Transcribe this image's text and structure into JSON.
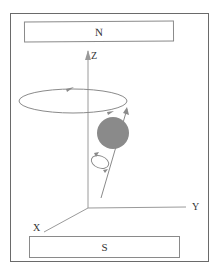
{
  "figure": {
    "poles": {
      "north": "N",
      "south": "S"
    },
    "axes": {
      "z": "Z",
      "y": "Y",
      "x": "X"
    },
    "sphere_color": "#8a8a8a",
    "line_color": "#8a8a8a",
    "border_color": "#6a6a6a"
  }
}
